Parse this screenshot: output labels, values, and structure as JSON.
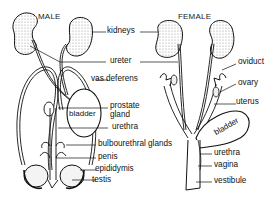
{
  "titles": {
    "male": "MALE",
    "female": "FEMALE"
  },
  "labels": {
    "kidneys": "kidneys",
    "ureter": "ureter",
    "vas_deferens": "vas deferens",
    "prostate_gland_1": "prostate",
    "prostate_gland_2": "gland",
    "urethra_male": "urethra",
    "bulbourethral_glands": "bulbourethral glands",
    "penis": "penis",
    "epididymis": "epididymis",
    "testis": "testis",
    "oviduct": "oviduct",
    "ovary": "ovary",
    "uterus": "uterus",
    "urethra_female": "urethra",
    "vagina": "vagina",
    "vestibule": "vestibule",
    "bladder_male": "bladder",
    "bladder_female": "bladder"
  }
}
